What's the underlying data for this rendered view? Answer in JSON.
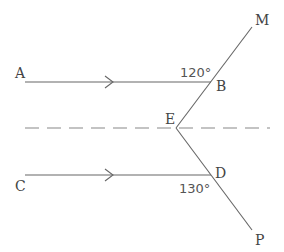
{
  "diagram": {
    "type": "geometry-parallel-lines",
    "points": {
      "A": "A",
      "B": "B",
      "C": "C",
      "D": "D",
      "E": "E",
      "M": "M",
      "P": "P"
    },
    "angles": {
      "at_B": "120°",
      "at_D": "130°"
    },
    "relations": [
      "AB ∥ CD (arrow marks)",
      "Dashed line through E parallel to AB and CD",
      "B lies on segment EM",
      "D lies on segment EP"
    ],
    "colors": {
      "line": "#666666",
      "dashed": "#888888",
      "text": "#444444"
    }
  }
}
